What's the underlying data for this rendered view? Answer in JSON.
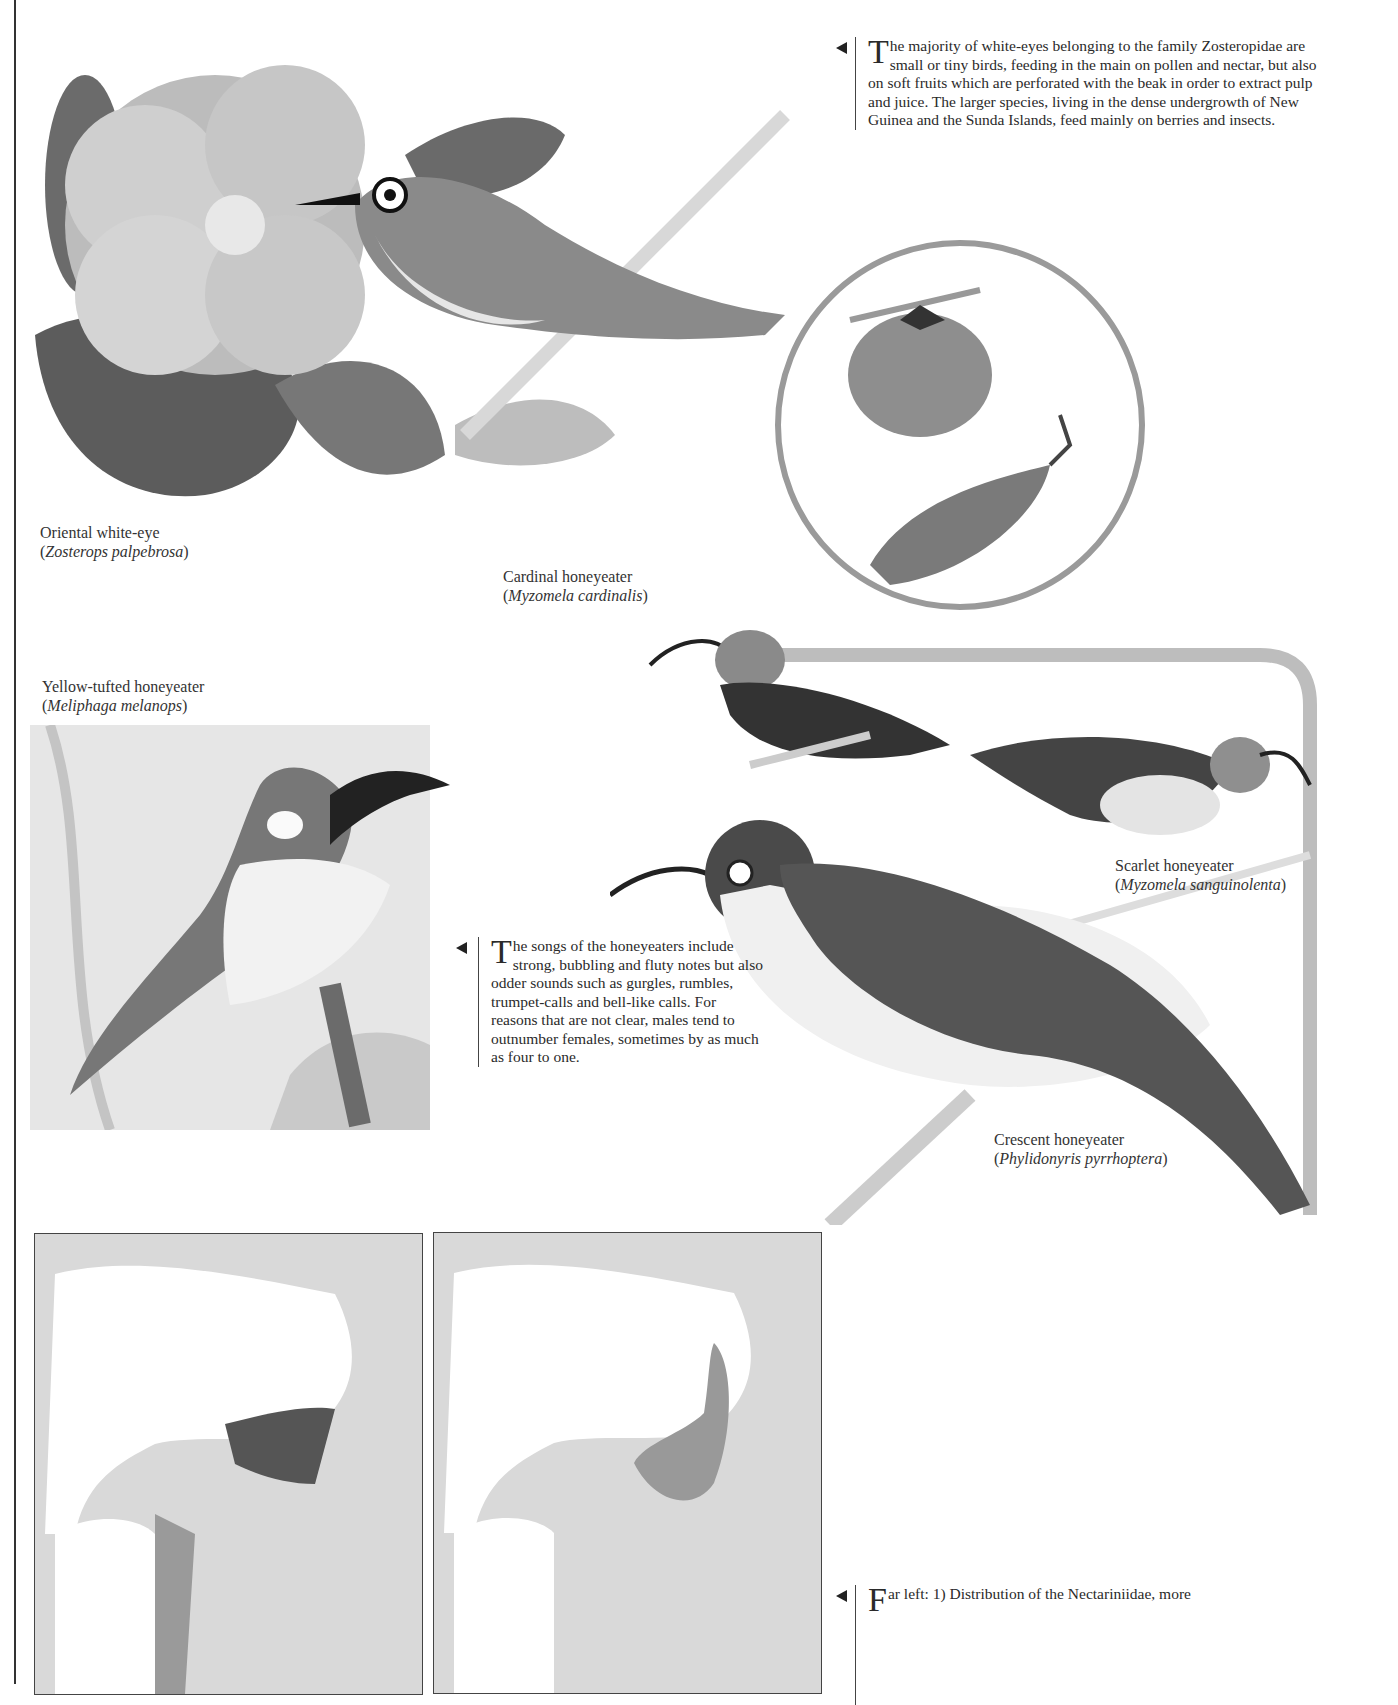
{
  "page": {
    "intro_text": {
      "dropcap": "T",
      "body": "he majority of white-eyes belonging to the family Zosteropidae are small or tiny birds, feeding in the main on pollen and nectar, but also on soft fruits which are perforated with the beak in order to extract pulp and juice. The larger species, living in the dense undergrowth of New Guinea and the Sunda Islands, feed mainly on berries and insects."
    },
    "songs_text": {
      "dropcap": "T",
      "body": "he songs of the honeyeaters include strong, bubbling and fluty notes but also odder sounds such as gurgles, rumbles, trumpet-calls and bell-like calls. For reasons that are not clear, males tend to outnumber females, sometimes by as much as four to one."
    },
    "maps_text": {
      "dropcap": "F",
      "body": "ar left: 1) Distribution of the Nectariniidae, more"
    },
    "captions": {
      "white_eye": {
        "common": "Oriental white-eye",
        "latin": "Zosterops palpebrosa"
      },
      "cardinal": {
        "common": "Cardinal honeyeater",
        "latin": "Myzomela cardinalis"
      },
      "yellow_tufted": {
        "common": "Yellow-tufted honeyeater",
        "latin": "Meliphaga melanops"
      },
      "scarlet": {
        "common": "Scarlet honeyeater",
        "latin": "Myzomela sanguinolenta"
      },
      "crescent": {
        "common": "Crescent honeyeater",
        "latin": "Phylidonyris pyrrhoptera"
      }
    },
    "punct": {
      "open": "(",
      "close": ")"
    }
  }
}
